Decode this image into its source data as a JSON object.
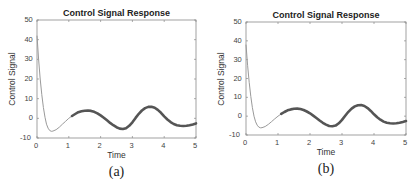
{
  "chart_data": [
    {
      "type": "line",
      "panel": "a",
      "title": "Control Signal Response",
      "xlabel": "Time",
      "ylabel": "Control Signal",
      "caption": "(a)",
      "xlim": [
        0,
        5
      ],
      "ylim": [
        -10,
        50
      ],
      "xticks": [
        "0",
        "1",
        "2",
        "3",
        "4",
        "5"
      ],
      "yticks": [
        "-10",
        "0",
        "10",
        "20",
        "30",
        "40",
        "50"
      ],
      "grid": false,
      "line_color": "#555555",
      "thin_color": "#9a9a9a",
      "thick_start_t": 1.2,
      "series": [
        {
          "name": "control signal",
          "x": [
            0,
            0.05,
            0.1,
            0.15,
            0.2,
            0.25,
            0.3,
            0.35,
            0.4,
            0.45,
            0.5,
            0.6,
            0.7,
            0.8,
            0.9,
            1.0,
            1.1,
            1.2,
            1.3,
            1.4,
            1.5,
            1.6,
            1.7,
            1.8,
            1.9,
            2.0,
            2.1,
            2.2,
            2.3,
            2.4,
            2.5,
            2.6,
            2.7,
            2.8,
            2.9,
            3.0,
            3.1,
            3.2,
            3.3,
            3.4,
            3.5,
            3.6,
            3.7,
            3.8,
            3.9,
            4.0,
            4.1,
            4.2,
            4.3,
            4.4,
            4.5,
            4.6,
            4.7,
            4.8,
            4.9,
            5.0
          ],
          "values": [
            42,
            30,
            20,
            12,
            5.5,
            0.5,
            -3,
            -5,
            -6.2,
            -6.6,
            -6.5,
            -5.8,
            -4.5,
            -3,
            -1.5,
            0,
            1.2,
            2.2,
            3.1,
            3.6,
            3.9,
            4.0,
            3.8,
            3.3,
            2.5,
            1.5,
            0.3,
            -1,
            -2.3,
            -3.5,
            -4.5,
            -5.2,
            -5.4,
            -5.0,
            -3.8,
            -2.0,
            0.2,
            2.3,
            4.0,
            5.2,
            5.8,
            5.9,
            5.4,
            4.3,
            2.8,
            1.0,
            -0.6,
            -1.9,
            -2.9,
            -3.5,
            -3.8,
            -3.9,
            -3.8,
            -3.5,
            -3.1,
            -2.6
          ]
        }
      ]
    },
    {
      "type": "line",
      "panel": "b",
      "title": "Control Signal Response",
      "xlabel": "Time",
      "ylabel": "Control Signal",
      "caption": "(b)",
      "xlim": [
        0,
        5
      ],
      "ylim": [
        -10,
        50
      ],
      "xticks": [
        "0",
        "1",
        "2",
        "3",
        "4",
        "5"
      ],
      "yticks": [
        "-10",
        "0",
        "10",
        "20",
        "30",
        "40",
        "50"
      ],
      "grid": false,
      "line_color": "#555555",
      "thin_color": "#9a9a9a",
      "thick_start_t": 1.15,
      "series": [
        {
          "name": "control signal",
          "x": [
            0,
            0.05,
            0.1,
            0.15,
            0.2,
            0.25,
            0.3,
            0.35,
            0.4,
            0.45,
            0.5,
            0.6,
            0.7,
            0.8,
            0.9,
            1.0,
            1.1,
            1.2,
            1.3,
            1.4,
            1.5,
            1.6,
            1.7,
            1.8,
            1.9,
            2.0,
            2.1,
            2.2,
            2.3,
            2.4,
            2.5,
            2.6,
            2.7,
            2.8,
            2.9,
            3.0,
            3.1,
            3.2,
            3.3,
            3.4,
            3.5,
            3.6,
            3.7,
            3.8,
            3.9,
            4.0,
            4.1,
            4.2,
            4.3,
            4.4,
            4.5,
            4.6,
            4.7,
            4.8,
            4.9,
            5.0
          ],
          "values": [
            38,
            27,
            18,
            10.5,
            4.5,
            0,
            -3,
            -4.8,
            -5.8,
            -6.2,
            -6.1,
            -5.5,
            -4.3,
            -2.9,
            -1.4,
            0,
            1.2,
            2.2,
            3.1,
            3.6,
            3.9,
            4.0,
            3.8,
            3.3,
            2.5,
            1.5,
            0.3,
            -1,
            -2.3,
            -3.5,
            -4.5,
            -5.2,
            -5.4,
            -5.0,
            -3.8,
            -2.0,
            0.2,
            2.3,
            4.0,
            5.2,
            5.8,
            5.9,
            5.4,
            4.3,
            2.8,
            1.0,
            -0.6,
            -1.9,
            -2.9,
            -3.5,
            -3.8,
            -3.9,
            -3.8,
            -3.5,
            -3.1,
            -2.6
          ]
        }
      ]
    }
  ],
  "layout": {
    "panels": [
      {
        "left": 37,
        "top": 20,
        "right": 196,
        "bottom": 138
      },
      {
        "left": 246,
        "top": 22,
        "right": 406,
        "bottom": 135
      }
    ]
  }
}
